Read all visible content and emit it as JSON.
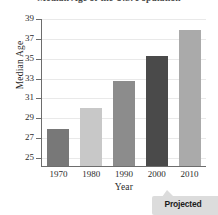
{
  "chart_data": {
    "type": "bar",
    "title": "Median Age of the U.S. Population",
    "xlabel": "Year",
    "ylabel": "Median Age",
    "categories": [
      "1970",
      "1980",
      "1990",
      "2000",
      "2010"
    ],
    "values": [
      27.9,
      30.0,
      32.8,
      35.3,
      37.9
    ],
    "bar_colors": [
      "#787878",
      "#c8c8c8",
      "#8c8c8c",
      "#4a4a4a",
      "#aaaaaa"
    ],
    "ylim": [
      24.2,
      39
    ],
    "ytick_labels": [
      "25",
      "27",
      "29",
      "31",
      "33",
      "35",
      "37",
      "39"
    ],
    "ytick_values": [
      25,
      27,
      29,
      31,
      33,
      35,
      37,
      39
    ],
    "xtick_labels": [
      "1970",
      "1980",
      "1990",
      "2000",
      "2010"
    ],
    "grid": true,
    "grid_axis": "y",
    "legend": false,
    "axis_break": true,
    "annotations": [
      {
        "text": "Projected",
        "target_category": "2010",
        "position": "bottom-right"
      }
    ]
  },
  "annotation": {
    "projected_label": "Projected"
  }
}
